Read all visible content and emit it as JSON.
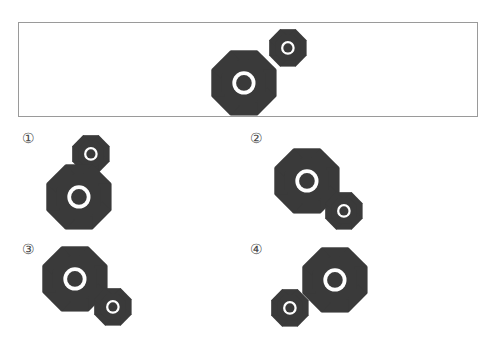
{
  "puzzle": {
    "type": "visual-rotation-multiple-choice",
    "background_color": "#ffffff",
    "gear_color": "#3a3a3a",
    "hub_ring_color": "#ffffff",
    "panel_border_color": "#9a9a9a"
  },
  "question": {
    "panel_name": "question-panel",
    "description": "Large gear at lower-left meshing with small gear at upper-right",
    "gears": [
      {
        "name": "large-gear",
        "size": "large",
        "teeth": 8,
        "x": 238,
        "y": 75,
        "radius": 29
      },
      {
        "name": "small-gear",
        "size": "small",
        "teeth": 8,
        "x": 284,
        "y": 48,
        "radius": 17
      }
    ]
  },
  "options": [
    {
      "label": "①",
      "name": "option-1",
      "description": "Small gear above, large gear below (vertical stack)",
      "gears": [
        {
          "name": "small-gear",
          "size": "small",
          "teeth": 8,
          "cx": 66,
          "cy": 25,
          "radius": 17
        },
        {
          "name": "large-gear",
          "size": "large",
          "teeth": 8,
          "cx": 52,
          "cy": 66,
          "radius": 29
        }
      ]
    },
    {
      "label": "②",
      "name": "option-2",
      "description": "Large gear upper-left, small gear lower-right",
      "gears": [
        {
          "name": "large-gear",
          "size": "large",
          "teeth": 8,
          "cx": 52,
          "cy": 50,
          "radius": 29
        },
        {
          "name": "small-gear",
          "size": "small",
          "teeth": 8,
          "cx": 91,
          "cy": 82,
          "radius": 17
        }
      ]
    },
    {
      "label": "③",
      "name": "option-3",
      "description": "Large gear upper-left, small gear lower-right, closely meshed",
      "gears": [
        {
          "name": "large-gear",
          "size": "large",
          "teeth": 8,
          "cx": 48,
          "cy": 37,
          "radius": 29
        },
        {
          "name": "small-gear",
          "size": "small",
          "teeth": 8,
          "cx": 88,
          "cy": 67,
          "radius": 17
        }
      ]
    },
    {
      "label": "④",
      "name": "option-4",
      "description": "Small gear lower-left, large gear upper-right",
      "gears": [
        {
          "name": "small-gear",
          "size": "small",
          "teeth": 8,
          "cx": 37,
          "cy": 68,
          "radius": 17
        },
        {
          "name": "large-gear",
          "size": "large",
          "teeth": 8,
          "cx": 80,
          "cy": 38,
          "radius": 29
        }
      ]
    }
  ]
}
